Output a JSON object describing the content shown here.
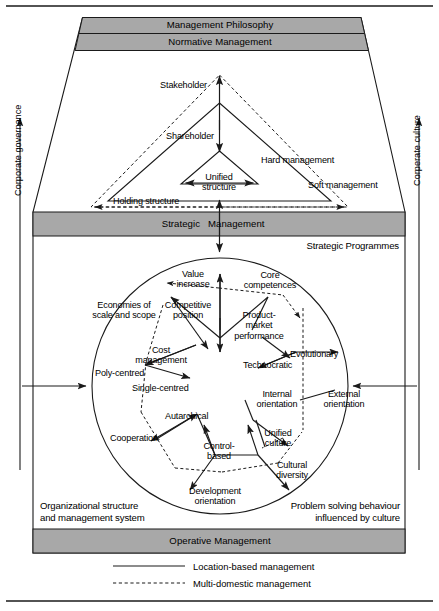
{
  "figure": {
    "title_bands": {
      "management_philosophy": "Management Philosophy",
      "normative_management": "Normative Management",
      "strategic": "Strategic",
      "management": "Management",
      "operative_management": "Operative Management"
    },
    "side_axes": {
      "left": "Corporate governance",
      "right": "Corperate culture"
    },
    "strategic_programmes": "Strategic Programmes",
    "corner_notes": {
      "left": "Organizational structure\nand management system",
      "right": "Problem solving behaviour\ninfluenced by culture"
    },
    "triangle_labels": {
      "stakeholder": "Stakeholder",
      "shareholder": "Shareholder",
      "hard_management": "Hard management",
      "soft_management": "Soft management",
      "unified_structure": "Unified\nstructure",
      "holding_structure": "Holding structure"
    },
    "circle_labels": {
      "value_increase": "Value\nincrease",
      "core_competences": "Core\ncompetences",
      "economies_of_scale": "Economies of\nscale and scope",
      "competitive_position": "Competitive\nposition",
      "product_market_performance": "Product-\nmarket\nperformance",
      "cost_management": "Cost\nmanagement",
      "evolutionary": "Evolutionary",
      "technocratic": "Technocratic",
      "poly_centred": "Poly-centred",
      "single_centred": "Single-centred",
      "internal_orientation": "Internal\norientation",
      "external_orientation": "External\norientation",
      "autarchical": "Autarchical",
      "cooperation": "Cooperation",
      "unified_culture": "Unified\nculture",
      "control_based": "Control-\nbased",
      "cultural_diversity": "Cultural\ndiversity",
      "development_orientation": "Development\norientation"
    },
    "legend": [
      {
        "style": "solid",
        "label": "Location-based management"
      },
      {
        "style": "dashed",
        "label": "Multi-domestic management"
      }
    ],
    "colors": {
      "band_fill": "#a8a8a8",
      "stroke": "#1a1a1a",
      "background": "#ffffff"
    }
  }
}
